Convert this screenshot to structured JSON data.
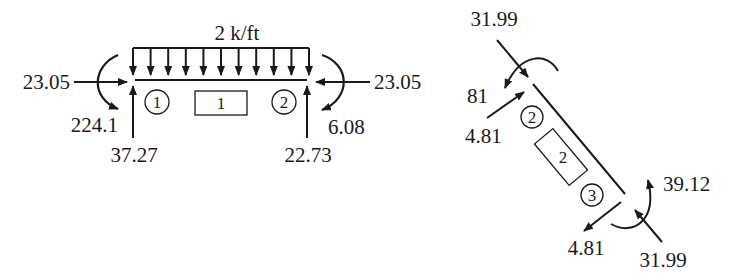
{
  "diagram": {
    "type": "free-body diagrams of frame members",
    "member1": {
      "id": "1",
      "distributed_load": "2 k/ft",
      "left_joint": {
        "id": "1",
        "horizontal_force": "23.05",
        "moment": "224.1",
        "vertical_force": "37.27"
      },
      "right_joint": {
        "id": "2",
        "horizontal_force": "23.05",
        "moment": "6.08",
        "vertical_force": "22.73"
      }
    },
    "member2": {
      "id": "2",
      "top_joint": {
        "id": "2",
        "axial_force": "31.99",
        "moment": "81",
        "shear_force": "4.81"
      },
      "bottom_joint": {
        "id": "3",
        "axial_force": "31.99",
        "moment": "39.12",
        "shear_force": "4.81"
      }
    }
  }
}
